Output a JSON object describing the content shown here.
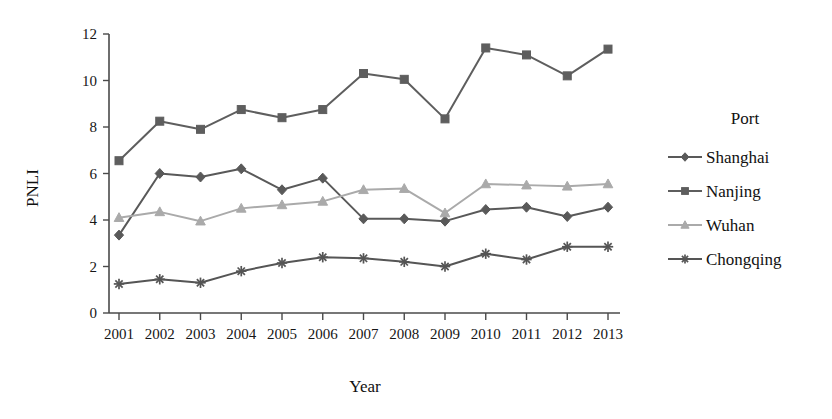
{
  "chart_data": {
    "type": "line",
    "title": "",
    "xlabel": "Year",
    "ylabel": "PNLI",
    "categories": [
      "2001",
      "2002",
      "2003",
      "2004",
      "2005",
      "2006",
      "2007",
      "2008",
      "2009",
      "2010",
      "2011",
      "2012",
      "2013"
    ],
    "x": [
      2001,
      2002,
      2003,
      2004,
      2005,
      2006,
      2007,
      2008,
      2009,
      2010,
      2011,
      2012,
      2013
    ],
    "xlim": [
      2000.5,
      2013.5
    ],
    "ylim": [
      0,
      12
    ],
    "yticks": [
      0,
      2,
      4,
      6,
      8,
      10,
      12
    ],
    "ytick_labels": [
      "0",
      "2",
      "4",
      "6",
      "8",
      "10",
      "12"
    ],
    "xtick_labels": [
      "2001",
      "2002",
      "2003",
      "2004",
      "2005",
      "2006",
      "2007",
      "2008",
      "2009",
      "2010",
      "2011",
      "2012",
      "2013"
    ],
    "grid": false,
    "legend_position": "right",
    "legend_title": "Port",
    "series": [
      {
        "name": "Shanghai",
        "marker": "diamond",
        "color": "#595959",
        "values": [
          3.35,
          6.0,
          5.85,
          6.2,
          5.3,
          5.8,
          4.05,
          4.05,
          3.95,
          4.45,
          4.55,
          4.15,
          4.55
        ]
      },
      {
        "name": "Nanjing",
        "marker": "square",
        "color": "#5e5e5e",
        "values": [
          6.55,
          8.25,
          7.9,
          8.75,
          8.4,
          8.75,
          10.3,
          10.05,
          8.35,
          11.4,
          11.1,
          10.2,
          11.35
        ]
      },
      {
        "name": "Wuhan",
        "marker": "triangle",
        "color": "#aaaaaa",
        "values": [
          4.1,
          4.35,
          3.95,
          4.5,
          4.65,
          4.8,
          5.3,
          5.35,
          4.3,
          5.55,
          5.5,
          5.45,
          5.55
        ]
      },
      {
        "name": "Chongqing",
        "marker": "star",
        "color": "#555555",
        "values": [
          1.25,
          1.45,
          1.3,
          1.8,
          2.15,
          2.4,
          2.35,
          2.2,
          2.0,
          2.55,
          2.3,
          2.85,
          2.85
        ]
      }
    ]
  },
  "axes": {
    "y_label": "PNLI",
    "x_label": "Year"
  },
  "legend": {
    "title": "Port",
    "entries": [
      {
        "label": "Shanghai"
      },
      {
        "label": "Nanjing"
      },
      {
        "label": "Wuhan"
      },
      {
        "label": "Chongqing"
      }
    ]
  }
}
